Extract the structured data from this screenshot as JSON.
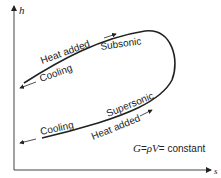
{
  "diagram": {
    "axes": {
      "y_label": "h",
      "x_label": "s"
    },
    "curve_labels": {
      "upper_heat": "Heat added",
      "upper_cool": "Cooling",
      "upper_regime": "Subsonic",
      "lower_regime": "Supersonic",
      "lower_cool": "Cooling",
      "lower_heat": "Heat added"
    },
    "equation": {
      "lhs": "G",
      "eq1": "=",
      "rho_v": "ρV",
      "eq2": "=",
      "rhs": " constant"
    },
    "colors": {
      "ink": "#222222",
      "background": "#ffffff"
    }
  }
}
